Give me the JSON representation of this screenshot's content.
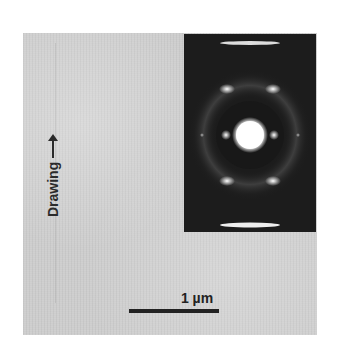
{
  "figure": {
    "type": "TEM micrograph with electron diffraction inset",
    "direction_label": "Drawing",
    "direction_arrow": "up-arrow",
    "scale_bar": {
      "label": "1 µm"
    },
    "colors": {
      "background": "#ffffff",
      "micrograph": "#cdcdcd",
      "inset": "#1c1c1c",
      "text": "#222222"
    }
  }
}
